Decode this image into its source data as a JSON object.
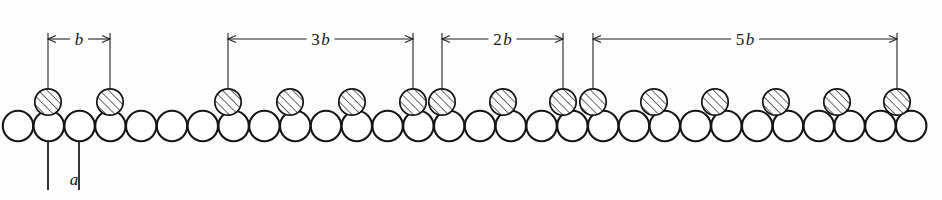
{
  "figure": {
    "background_color": "#fdfdfd",
    "line_color": "#141418",
    "width": 942,
    "height": 200
  },
  "dimensions": [
    {
      "id": "b",
      "label_num": "",
      "label_sym": "b",
      "text": "b",
      "x_start": 48,
      "x_end": 110,
      "y_line": 39,
      "multiple": 1
    },
    {
      "id": "3b",
      "label_num": "3",
      "label_sym": "b",
      "text": "3b",
      "x_start": 228,
      "x_end": 413,
      "y_line": 39,
      "multiple": 3
    },
    {
      "id": "2b",
      "label_num": "2",
      "label_sym": "b",
      "text": "2b",
      "x_start": 442,
      "x_end": 563,
      "y_line": 39,
      "multiple": 2
    },
    {
      "id": "5b",
      "label_num": "5",
      "label_sym": "b",
      "text": "5b",
      "x_start": 593,
      "x_end": 897,
      "y_line": 39,
      "multiple": 5
    }
  ],
  "spacing_callout": {
    "id": "a",
    "text": "a",
    "label_x": 74,
    "label_y": 185,
    "leader_left_x": 48,
    "leader_right_x": 79,
    "leader_top_y": 118,
    "leader_bottom_y": 190
  },
  "atom_row": {
    "open_atom_radius": 15.2,
    "open_atom_center_y": 126,
    "open_atom_start_x": 18,
    "open_atom_pitch": 30.8,
    "open_atom_count": 30,
    "hatched_atom_radius": 13.2,
    "hatched_atom_center_y": 102,
    "hatched_atom_x_positions": [
      48,
      110,
      228,
      290,
      352,
      413,
      442,
      503,
      563,
      593,
      654,
      715,
      776,
      837,
      897
    ],
    "hatch_spacing": 4.4,
    "hatch_angle_deg": 45
  }
}
